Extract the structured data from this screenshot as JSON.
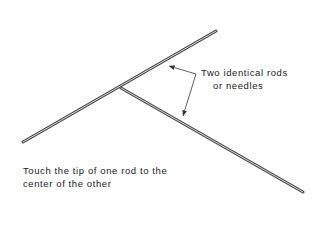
{
  "diagram": {
    "label_rods_line1": "Two identical rods",
    "label_rods_line2": "or needles",
    "caption_line1": "Touch the tip of one rod to the",
    "caption_line2": "center of the other"
  }
}
